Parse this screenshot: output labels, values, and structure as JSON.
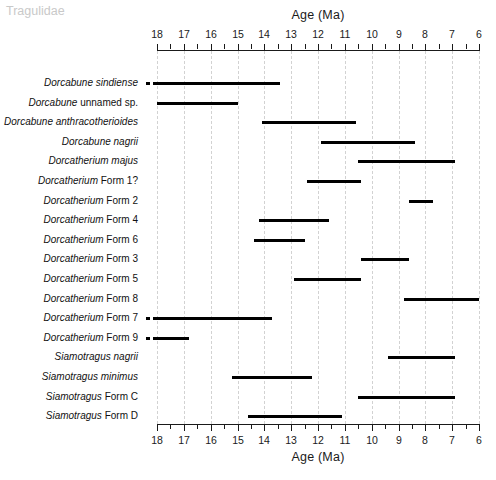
{
  "chart_data": {
    "type": "bar",
    "title": "",
    "xlabel": "Age (Ma)",
    "ylabel": "",
    "xlim": [
      18,
      6
    ],
    "x_axis_reversed": true,
    "grid": true,
    "legend": false,
    "tick_labels": [
      "18",
      "17",
      "16",
      "15",
      "14",
      "13",
      "12",
      "11",
      "10",
      "9",
      "8",
      "7",
      "6"
    ],
    "tick_values": [
      18,
      17,
      16,
      15,
      14,
      13,
      12,
      11,
      10,
      9,
      8,
      7,
      6
    ],
    "group_header": "Tragulidae",
    "orientation": "horizontal-ranges",
    "categories": [
      "Dorcabune sindiense",
      "Dorcabune unnamed sp.",
      "Dorcabune anthracotherioides",
      "Dorcabune nagrii",
      "Dorcatherium majus",
      "Dorcatherium Form 1?",
      "Dorcatherium Form 2",
      "Dorcatherium Form 4",
      "Dorcatherium Form 6",
      "Dorcatherium Form 3",
      "Dorcatherium Form 5",
      "Dorcatherium Form 8",
      "Dorcatherium Form 7",
      "Dorcatherium Form 9",
      "Siamotragus nagrii",
      "Siamotragus minimus",
      "Siamotragus Form C",
      "Siamotragus Form D"
    ],
    "ranges": [
      {
        "label": "Dorcabune sindiense",
        "genus": "Dorcabune",
        "rest": "sindiense",
        "rest_italic": true,
        "start": 18.0,
        "end": 13.4,
        "dashed_start": 18.4,
        "dashed_end": 18.0
      },
      {
        "label": "Dorcabune unnamed sp.",
        "genus": "Dorcabune",
        "rest": "unnamed sp.",
        "rest_italic": false,
        "start": 18.0,
        "end": 15.0,
        "dashed_start": null,
        "dashed_end": null
      },
      {
        "label": "Dorcabune anthracotherioides",
        "genus": "Dorcabune",
        "rest": "anthracotherioides",
        "rest_italic": true,
        "start": 14.1,
        "end": 10.6,
        "dashed_start": null,
        "dashed_end": null
      },
      {
        "label": "Dorcabune nagrii",
        "genus": "Dorcabune",
        "rest": "nagrii",
        "rest_italic": true,
        "start": 11.9,
        "end": 8.4,
        "dashed_start": null,
        "dashed_end": null
      },
      {
        "label": "Dorcatherium majus",
        "genus": "Dorcatherium",
        "rest": "majus",
        "rest_italic": true,
        "start": 10.5,
        "end": 6.9,
        "dashed_start": null,
        "dashed_end": null
      },
      {
        "label": "Dorcatherium Form 1?",
        "genus": "Dorcatherium",
        "rest": "Form 1?",
        "rest_italic": false,
        "start": 12.4,
        "end": 10.4,
        "dashed_start": null,
        "dashed_end": null
      },
      {
        "label": "Dorcatherium Form 2",
        "genus": "Dorcatherium",
        "rest": "Form 2",
        "rest_italic": false,
        "start": 8.6,
        "end": 7.7,
        "dashed_start": null,
        "dashed_end": null
      },
      {
        "label": "Dorcatherium Form 4",
        "genus": "Dorcatherium",
        "rest": "Form 4",
        "rest_italic": false,
        "start": 14.2,
        "end": 11.6,
        "dashed_start": null,
        "dashed_end": null
      },
      {
        "label": "Dorcatherium Form 6",
        "genus": "Dorcatherium",
        "rest": "Form 6",
        "rest_italic": false,
        "start": 14.4,
        "end": 12.5,
        "dashed_start": null,
        "dashed_end": null
      },
      {
        "label": "Dorcatherium Form 3",
        "genus": "Dorcatherium",
        "rest": "Form 3",
        "rest_italic": false,
        "start": 10.4,
        "end": 8.6,
        "dashed_start": null,
        "dashed_end": null
      },
      {
        "label": "Dorcatherium Form 5",
        "genus": "Dorcatherium",
        "rest": "Form 5",
        "rest_italic": false,
        "start": 12.9,
        "end": 10.4,
        "dashed_start": null,
        "dashed_end": null
      },
      {
        "label": "Dorcatherium Form 8",
        "genus": "Dorcatherium",
        "rest": "Form 8",
        "rest_italic": false,
        "start": 8.8,
        "end": 6.0,
        "dashed_start": null,
        "dashed_end": null
      },
      {
        "label": "Dorcatherium Form 7",
        "genus": "Dorcatherium",
        "rest": "Form 7",
        "rest_italic": false,
        "start": 18.0,
        "end": 13.7,
        "dashed_start": 18.4,
        "dashed_end": 18.0
      },
      {
        "label": "Dorcatherium Form 9",
        "genus": "Dorcatherium",
        "rest": "Form 9",
        "rest_italic": false,
        "start": 18.0,
        "end": 16.8,
        "dashed_start": 18.4,
        "dashed_end": 18.0
      },
      {
        "label": "Siamotragus nagrii",
        "genus": "Siamotragus",
        "rest": "nagrii",
        "rest_italic": true,
        "start": 9.4,
        "end": 6.9,
        "dashed_start": null,
        "dashed_end": null
      },
      {
        "label": "Siamotragus minimus",
        "genus": "Siamotragus",
        "rest": "minimus",
        "rest_italic": true,
        "start": 15.2,
        "end": 12.2,
        "dashed_start": null,
        "dashed_end": null
      },
      {
        "label": "Siamotragus Form C",
        "genus": "Siamotragus",
        "rest": "Form C",
        "rest_italic": false,
        "start": 10.5,
        "end": 6.9,
        "dashed_start": null,
        "dashed_end": null
      },
      {
        "label": "Siamotragus Form D",
        "genus": "Siamotragus",
        "rest": "Form D",
        "rest_italic": false,
        "start": 14.6,
        "end": 11.1,
        "dashed_start": null,
        "dashed_end": null
      }
    ]
  },
  "axis": {
    "title_top": "Age (Ma)",
    "title_bottom": "Age (Ma)"
  },
  "colors": {
    "bar": "#000000",
    "grid": "#d2d2d2",
    "axis": "#1a1a1a",
    "group_header": "#c9c9c9"
  }
}
